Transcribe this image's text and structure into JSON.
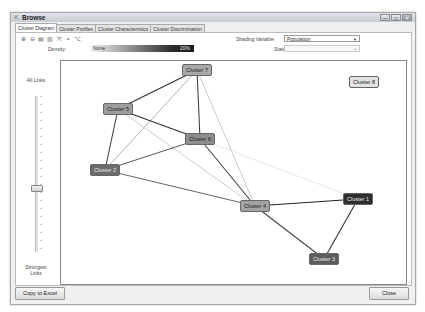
{
  "window": {
    "title": "Browse",
    "title_icon": "browse-icon",
    "controls": {
      "minimize": "—",
      "maximize": "□",
      "close": "✕"
    }
  },
  "tabs": [
    {
      "label": "Cluster Diagram",
      "active": true
    },
    {
      "label": "Cluster Profiles",
      "active": false
    },
    {
      "label": "Cluster Characteristics",
      "active": false
    },
    {
      "label": "Cluster Discrimination",
      "active": false
    }
  ],
  "toolbar": {
    "icons": [
      "zoom-in-icon",
      "zoom-out-icon",
      "copy-icon",
      "paste-icon",
      "fit-to-screen-icon",
      "print-icon",
      "layout-icon"
    ],
    "glyphs": [
      "⊕",
      "⊖",
      "▤",
      "▥",
      "⤧",
      "▪",
      "⌥"
    ]
  },
  "shading": {
    "label": "Shading Variable:",
    "value": "Population"
  },
  "state": {
    "label": "State:",
    "value": ""
  },
  "density": {
    "label": "Density:",
    "low_label": "None",
    "high_label": "20%"
  },
  "slider": {
    "top_label": "All Links",
    "bottom_label_1": "Strongest",
    "bottom_label_2": "Links"
  },
  "nodes": [
    {
      "id": "c7",
      "label": "Cluster 7",
      "x": 136,
      "y": 9,
      "fill": "#a9a9a9",
      "text": "#222"
    },
    {
      "id": "c5",
      "label": "Cluster 5",
      "x": 57,
      "y": 48,
      "fill": "#9d9d9d",
      "text": "#222"
    },
    {
      "id": "c6",
      "label": "Cluster 6",
      "x": 139,
      "y": 78,
      "fill": "#8e8e8e",
      "text": "#222"
    },
    {
      "id": "c2",
      "label": "Cluster 2",
      "x": 44,
      "y": 109,
      "fill": "#6b6b6b",
      "text": "#eee"
    },
    {
      "id": "c4",
      "label": "Cluster 4",
      "x": 194,
      "y": 145,
      "fill": "#a2a2a2",
      "text": "#222"
    },
    {
      "id": "c1",
      "label": "Cluster 1",
      "x": 297,
      "y": 138,
      "fill": "#2e2e2e",
      "text": "#eee"
    },
    {
      "id": "c3",
      "label": "Cluster 3",
      "x": 263,
      "y": 198,
      "fill": "#5c5c5c",
      "text": "#eee"
    },
    {
      "id": "c8",
      "label": "Cluster 8",
      "x": 303,
      "y": 21,
      "fill": "#e3e3e3",
      "text": "#222"
    }
  ],
  "links": [
    {
      "from": "c7",
      "to": "c5",
      "color": "#333",
      "w": 1.2
    },
    {
      "from": "c7",
      "to": "c2",
      "color": "#aaa",
      "w": 0.9
    },
    {
      "from": "c7",
      "to": "c6",
      "color": "#444",
      "w": 1.1
    },
    {
      "from": "c7",
      "to": "c4",
      "color": "#bbb",
      "w": 0.8
    },
    {
      "from": "c5",
      "to": "c6",
      "color": "#333",
      "w": 1.2
    },
    {
      "from": "c5",
      "to": "c2",
      "color": "#444",
      "w": 1.1
    },
    {
      "from": "c5",
      "to": "c4",
      "color": "#c2c2c2",
      "w": 0.8
    },
    {
      "from": "c6",
      "to": "c2",
      "color": "#555",
      "w": 1.0
    },
    {
      "from": "c6",
      "to": "c4",
      "color": "#444",
      "w": 1.1
    },
    {
      "from": "c6",
      "to": "c1",
      "color": "#ddd",
      "w": 0.7
    },
    {
      "from": "c2",
      "to": "c4",
      "color": "#666",
      "w": 1.0
    },
    {
      "from": "c4",
      "to": "c1",
      "color": "#222",
      "w": 1.2
    },
    {
      "from": "c4",
      "to": "c3",
      "color": "#444",
      "w": 1.1
    },
    {
      "from": "c1",
      "to": "c3",
      "color": "#333",
      "w": 1.1
    }
  ],
  "footer": {
    "copy_label": "Copy to Excel",
    "close_label": "Close"
  }
}
